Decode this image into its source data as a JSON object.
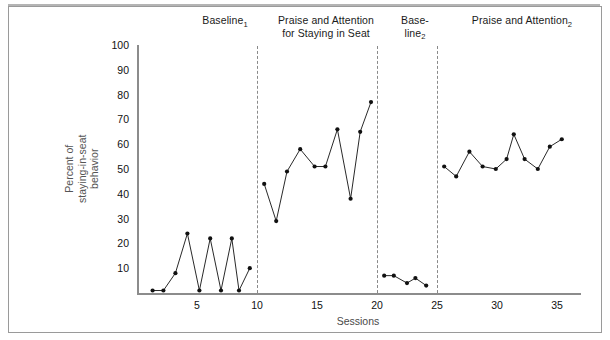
{
  "chart_data": {
    "type": "line",
    "title": "",
    "xlabel": "Sessions",
    "ylabel": "Percent of staying-in-seat behavior",
    "xlim": [
      0,
      37
    ],
    "ylim": [
      0,
      100
    ],
    "xticks": [
      5,
      10,
      15,
      20,
      25,
      30,
      35
    ],
    "yticks": [
      10,
      20,
      30,
      40,
      50,
      60,
      70,
      80,
      90,
      100
    ],
    "grid": false,
    "legend": "none",
    "phase_dividers": [
      10,
      20,
      25
    ],
    "phases": [
      {
        "name": "Baseline 1",
        "label_lines": [
          "Baseline"
        ],
        "label_sub": "1",
        "x": [
          1.3,
          2.2,
          3.2,
          4.2,
          5.2,
          6.1,
          7.0,
          7.9,
          8.5,
          9.4
        ],
        "y": [
          1,
          1,
          8,
          24,
          1,
          22,
          1,
          22,
          1,
          10
        ]
      },
      {
        "name": "Praise and Attention 1",
        "label_lines": [
          "Praise and Attention",
          "for Staying in Seat"
        ],
        "label_sub": "",
        "x": [
          10.6,
          11.6,
          12.5,
          13.6,
          14.8,
          15.7,
          16.7,
          17.8,
          18.6,
          19.5
        ],
        "y": [
          44,
          29,
          49,
          58,
          51,
          51,
          66,
          38,
          65,
          77
        ]
      },
      {
        "name": "Baseline 2",
        "label_lines": [
          "Base-",
          "line"
        ],
        "label_sub": "2",
        "x": [
          20.6,
          21.4,
          22.5,
          23.2,
          24.1
        ],
        "y": [
          7,
          7,
          4,
          6,
          3
        ]
      },
      {
        "name": "Praise and Attention 2",
        "label_lines": [
          "Praise and Attention"
        ],
        "label_sub": "2",
        "x": [
          25.6,
          26.6,
          27.7,
          28.8,
          29.9,
          30.8,
          31.4,
          32.3,
          33.4,
          34.4,
          35.4
        ],
        "y": [
          51,
          47,
          57,
          51,
          50,
          54,
          64,
          54,
          50,
          59,
          62
        ]
      }
    ]
  },
  "labels": {
    "phase1_main": "Baseline",
    "phase1_sub": "1",
    "phase2_line1": "Praise and Attention",
    "phase2_line2": "for Staying in Seat",
    "phase3_line1": "Base-",
    "phase3_line2": "line",
    "phase3_sub": "2",
    "phase4_main": "Praise and Attention",
    "phase4_sub": "2",
    "ylabel_line1": "Percent of",
    "ylabel_line2": "staying-in-seat",
    "ylabel_line3": "behavior",
    "xlabel": "Sessions",
    "y_100": "100",
    "y_90": "90",
    "y_80": "80",
    "y_70": "70",
    "y_60": "60",
    "y_50": "50",
    "y_40": "40",
    "y_30": "30",
    "y_20": "20",
    "y_10": "10",
    "x_5": "5",
    "x_10": "10",
    "x_15": "15",
    "x_20": "20",
    "x_25": "25",
    "x_30": "30",
    "x_35": "35"
  },
  "colors": {
    "line": "#111111",
    "marker": "#111111",
    "axis": "#8c8c8c",
    "divider": "#8a8a8a",
    "frame": "#9a9a9a",
    "text": "#111111",
    "ylabel_text": "#555555"
  }
}
